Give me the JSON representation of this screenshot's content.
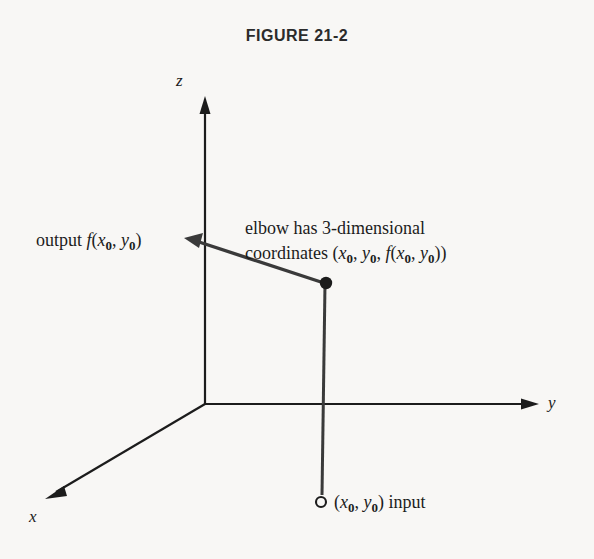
{
  "figure": {
    "title": "FIGURE 21-2",
    "background_color": "#f8f7f5",
    "ink_color": "#1c1c1c"
  },
  "axes": {
    "z_label": "z",
    "y_label": "y",
    "x_label": "x",
    "origin": {
      "x": 205,
      "y": 404
    },
    "z_tip": {
      "x": 205,
      "y": 98
    },
    "y_tip": {
      "x": 538,
      "y": 404
    },
    "x_tip": {
      "x": 45,
      "y": 500
    }
  },
  "points": {
    "elbow": {
      "x": 326,
      "y": 283,
      "style": "filled-dot"
    },
    "input": {
      "x": 321,
      "y": 502,
      "style": "open-circle"
    },
    "output_arrow_tip": {
      "x": 185,
      "y": 238
    }
  },
  "labels": {
    "output": {
      "prefix": "output ",
      "fn": "f",
      "open": "(",
      "var1": "x",
      "sub1": "0",
      "comma": ", ",
      "var2": "y",
      "sub2": "0",
      "close": ")"
    },
    "elbow_line1": "elbow has 3-dimensional",
    "elbow_line2_prefix": "coordinates (",
    "elbow_line2_v1": "x",
    "elbow_line2_s1": "0",
    "elbow_line2_sep1": ", ",
    "elbow_line2_v2": "y",
    "elbow_line2_s2": "0",
    "elbow_line2_sep2": ", ",
    "elbow_line2_fn": "f",
    "elbow_line2_open2": "(",
    "elbow_line2_v3": "x",
    "elbow_line2_s3": "0",
    "elbow_line2_sep3": ", ",
    "elbow_line2_v4": "y",
    "elbow_line2_s4": "0",
    "elbow_line2_close": "))",
    "input_open": "(",
    "input_v1": "x",
    "input_s1": "0",
    "input_sep": ", ",
    "input_v2": "y",
    "input_s2": "0",
    "input_close": ") ",
    "input_word": "input"
  }
}
